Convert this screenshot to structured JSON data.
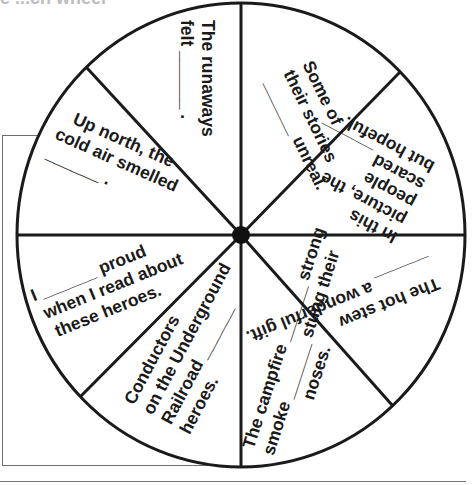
{
  "header": {
    "cut_off_text": "e ...ch wheel"
  },
  "wheel": {
    "center_dot": "spinner-center",
    "sectors": [
      {
        "id": "runaways",
        "lines": [
          "The runaways",
          "felt ______ ."
        ]
      },
      {
        "id": "stories",
        "lines": [
          "Some of",
          "their stories",
          "______ unreal."
        ]
      },
      {
        "id": "picture",
        "lines": [
          "In this",
          "picture, the",
          "people",
          "scared ______",
          "but hopeful."
        ]
      },
      {
        "id": "stew",
        "lines": [
          "The hot stew",
          "______ a wonderful gift."
        ]
      },
      {
        "id": "campfire",
        "lines": [
          "The campfire ______ strong",
          "smoke ______ stung their",
          "noses."
        ]
      },
      {
        "id": "conductors",
        "lines": [
          "Conductors",
          "on the Underground",
          "Railroad ______",
          "heroes."
        ]
      },
      {
        "id": "proud",
        "lines": [
          "I ______ proud",
          "when I read about",
          "these heroes."
        ]
      },
      {
        "id": "up-north",
        "lines": [
          "Up north, the",
          "cold air smelled",
          "______ ."
        ]
      }
    ]
  }
}
